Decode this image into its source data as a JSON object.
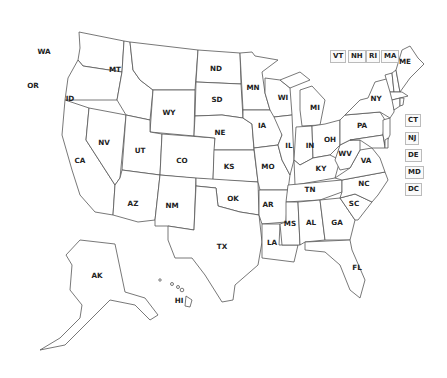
{
  "map": {
    "title": "United States map with state abbreviations",
    "colors": {
      "fill": "#ffffff",
      "stroke": "#555555",
      "label": "#222222",
      "box_border": "#bbbbbb"
    },
    "states": [
      {
        "abbr": "WA",
        "x": 44,
        "y": 54
      },
      {
        "abbr": "OR",
        "x": 33,
        "y": 88
      },
      {
        "abbr": "ID",
        "x": 70,
        "y": 101
      },
      {
        "abbr": "MT",
        "x": 115,
        "y": 72
      },
      {
        "abbr": "WY",
        "x": 169,
        "y": 115
      },
      {
        "abbr": "ND",
        "x": 216,
        "y": 71
      },
      {
        "abbr": "SD",
        "x": 217,
        "y": 102
      },
      {
        "abbr": "NE",
        "x": 220,
        "y": 135
      },
      {
        "abbr": "MN",
        "x": 253,
        "y": 90
      },
      {
        "abbr": "WI",
        "x": 283,
        "y": 100
      },
      {
        "abbr": "MI",
        "x": 315,
        "y": 110
      },
      {
        "abbr": "IA",
        "x": 262,
        "y": 128
      },
      {
        "abbr": "IL",
        "x": 289,
        "y": 148
      },
      {
        "abbr": "IN",
        "x": 310,
        "y": 148
      },
      {
        "abbr": "OH",
        "x": 330,
        "y": 142
      },
      {
        "abbr": "PA",
        "x": 362,
        "y": 128
      },
      {
        "abbr": "NY",
        "x": 376,
        "y": 101
      },
      {
        "abbr": "ME",
        "x": 405,
        "y": 64
      },
      {
        "abbr": "NV",
        "x": 104,
        "y": 145
      },
      {
        "abbr": "UT",
        "x": 140,
        "y": 153
      },
      {
        "abbr": "CO",
        "x": 182,
        "y": 163
      },
      {
        "abbr": "KS",
        "x": 229,
        "y": 169
      },
      {
        "abbr": "MO",
        "x": 268,
        "y": 169
      },
      {
        "abbr": "KY",
        "x": 321,
        "y": 171
      },
      {
        "abbr": "WV",
        "x": 345,
        "y": 156
      },
      {
        "abbr": "VA",
        "x": 366,
        "y": 163
      },
      {
        "abbr": "CA",
        "x": 80,
        "y": 163
      },
      {
        "abbr": "AZ",
        "x": 133,
        "y": 206
      },
      {
        "abbr": "NM",
        "x": 172,
        "y": 208
      },
      {
        "abbr": "OK",
        "x": 233,
        "y": 201
      },
      {
        "abbr": "AR",
        "x": 268,
        "y": 207
      },
      {
        "abbr": "TN",
        "x": 310,
        "y": 192
      },
      {
        "abbr": "NC",
        "x": 364,
        "y": 186
      },
      {
        "abbr": "SC",
        "x": 354,
        "y": 206
      },
      {
        "abbr": "MS",
        "x": 290,
        "y": 226
      },
      {
        "abbr": "AL",
        "x": 311,
        "y": 225
      },
      {
        "abbr": "GA",
        "x": 337,
        "y": 225
      },
      {
        "abbr": "LA",
        "x": 272,
        "y": 245
      },
      {
        "abbr": "TX",
        "x": 222,
        "y": 249
      },
      {
        "abbr": "FL",
        "x": 357,
        "y": 270
      },
      {
        "abbr": "AK",
        "x": 97,
        "y": 278
      },
      {
        "abbr": "HI",
        "x": 179,
        "y": 303
      }
    ],
    "boxed_states": [
      {
        "abbr": "VT",
        "x": 330,
        "y": 50
      },
      {
        "abbr": "NH",
        "x": 348,
        "y": 50
      },
      {
        "abbr": "RI",
        "x": 366,
        "y": 50
      },
      {
        "abbr": "MA",
        "x": 381,
        "y": 50
      },
      {
        "abbr": "CT",
        "x": 405,
        "y": 114
      },
      {
        "abbr": "NJ",
        "x": 405,
        "y": 132
      },
      {
        "abbr": "DE",
        "x": 405,
        "y": 149
      },
      {
        "abbr": "MD",
        "x": 405,
        "y": 166
      },
      {
        "abbr": "DC",
        "x": 405,
        "y": 183
      }
    ]
  }
}
